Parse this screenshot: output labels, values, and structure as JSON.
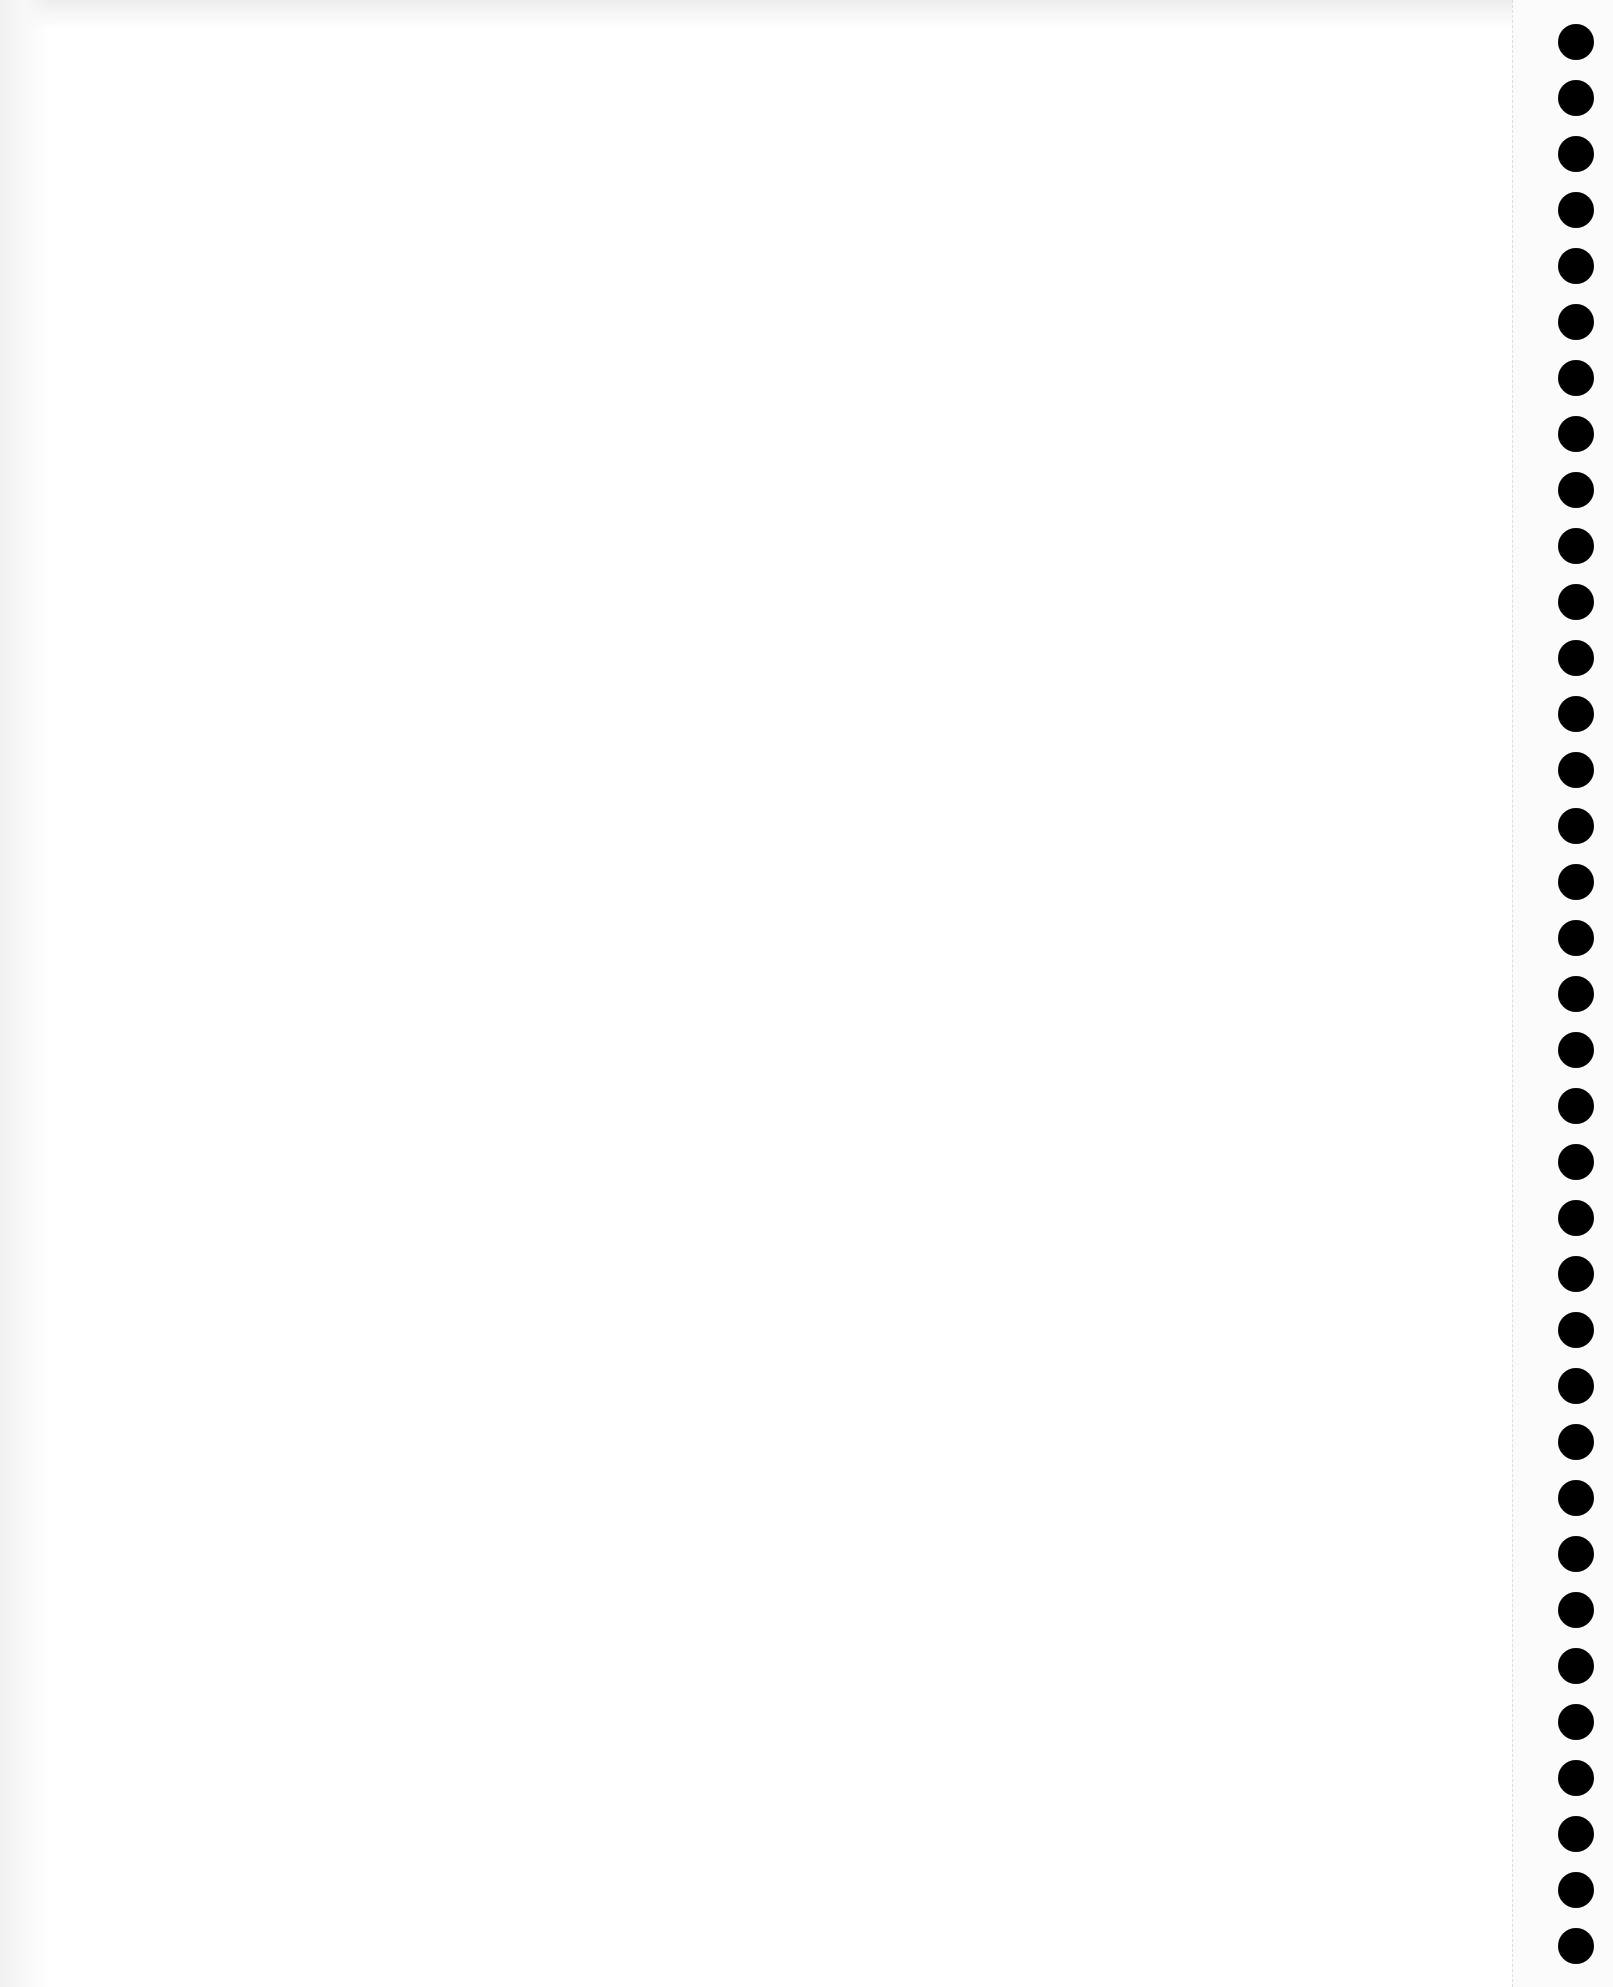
{
  "document": {
    "type": "blank continuous-form page",
    "text": "",
    "background_color": "#ffffff",
    "hole_color": "#000000",
    "feed_holes_count": 35
  }
}
